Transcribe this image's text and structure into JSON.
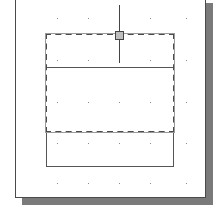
{
  "drawing": {
    "canvas": {
      "background": "#ffffff",
      "border": "#4a4a4a",
      "shadow": "#7a7a7a"
    },
    "grid": {
      "dot_color": "#8a8a8a",
      "x": [
        57,
        88,
        119,
        150,
        186
      ],
      "y": [
        18,
        60,
        102,
        143,
        183
      ]
    },
    "shapes": [
      {
        "name": "selected-rectangle",
        "style": "dashed",
        "selected": true
      },
      {
        "name": "divider-line",
        "style": "solid"
      },
      {
        "name": "lower-rectangle",
        "style": "solid"
      },
      {
        "name": "crosshair-cursor",
        "style": "solid"
      },
      {
        "name": "grip-square",
        "style": "filled"
      }
    ]
  }
}
